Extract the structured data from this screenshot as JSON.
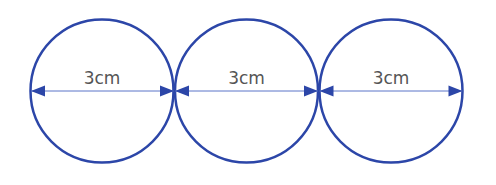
{
  "diagram": {
    "colors": {
      "circle_stroke": "#2c46a8",
      "arrow_line": "#5b74c8",
      "arrow_head": "#2c46a8",
      "label_text": "#555555",
      "background": "#ffffff"
    },
    "circles": [
      {
        "id": "circle-1",
        "cx": 102,
        "cy": 91,
        "r": 72,
        "label": "3cm"
      },
      {
        "id": "circle-2",
        "cx": 246,
        "cy": 91,
        "r": 72,
        "label": "3cm"
      },
      {
        "id": "circle-3",
        "cx": 391,
        "cy": 91,
        "r": 72,
        "label": "3cm"
      }
    ]
  }
}
